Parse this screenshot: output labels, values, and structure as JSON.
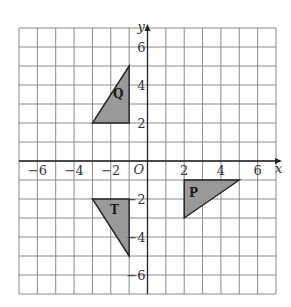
{
  "diagram": {
    "type": "coordinate-grid",
    "x_range": [
      -7,
      7
    ],
    "y_range": [
      -7,
      7
    ],
    "axis_labels": {
      "x": "x",
      "y": "y",
      "origin": "O"
    },
    "x_ticks": [
      {
        "value": -6,
        "label": "−6"
      },
      {
        "value": -4,
        "label": "−4"
      },
      {
        "value": -2,
        "label": "−2"
      },
      {
        "value": 2,
        "label": "2"
      },
      {
        "value": 4,
        "label": "4"
      },
      {
        "value": 6,
        "label": "6"
      }
    ],
    "y_ticks": [
      {
        "value": 6,
        "label": "6"
      },
      {
        "value": 4,
        "label": "4"
      },
      {
        "value": 2,
        "label": "2"
      },
      {
        "value": -2,
        "label": "−2"
      },
      {
        "value": -4,
        "label": "−4"
      },
      {
        "value": -6,
        "label": "−6"
      }
    ],
    "shapes": [
      {
        "name": "Q",
        "vertices": [
          [
            -3,
            2
          ],
          [
            -1,
            2
          ],
          [
            -1,
            5
          ]
        ],
        "label_pos": [
          -1.6,
          3.3
        ]
      },
      {
        "name": "T",
        "vertices": [
          [
            -3,
            -2
          ],
          [
            -1,
            -2
          ],
          [
            -1,
            -5
          ]
        ],
        "label_pos": [
          -1.8,
          -2.8
        ]
      },
      {
        "name": "P",
        "vertices": [
          [
            2,
            -1
          ],
          [
            5,
            -1
          ],
          [
            2,
            -3
          ]
        ],
        "label_pos": [
          2.5,
          -1.9
        ]
      }
    ],
    "colors": {
      "grid": "#8a8a8a",
      "fill": "#999999",
      "stroke": "#222222",
      "axis": "#222222"
    }
  }
}
